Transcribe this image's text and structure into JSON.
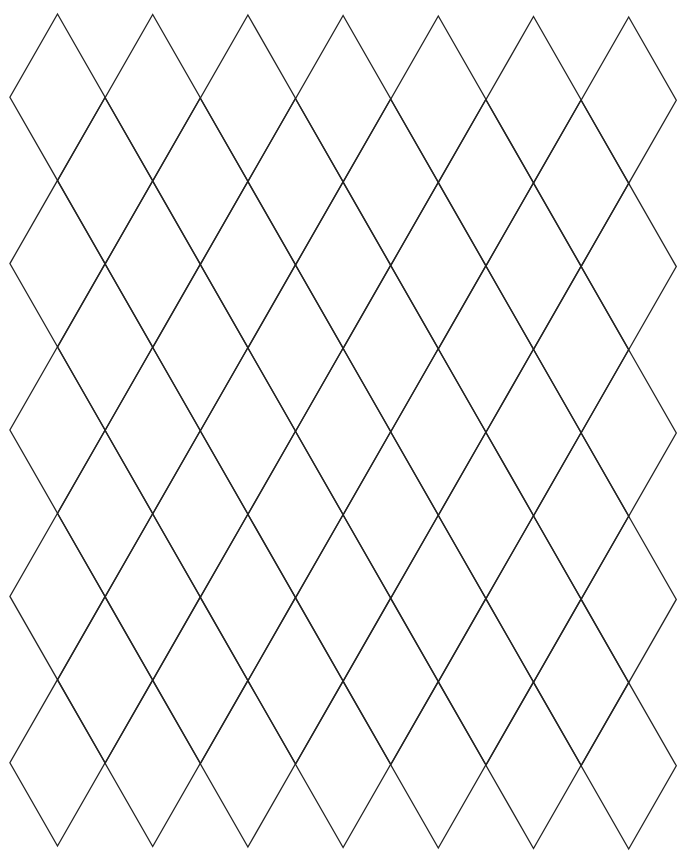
{
  "page": {
    "background": "#ffffff"
  },
  "grid": {
    "pattern": "diamond-lattice",
    "columns": 7,
    "rows": 5,
    "origin_top_vertex": [
      57.5,
      14
    ],
    "column_spacing": 95.2,
    "row_spacing": 166.4,
    "half_width": 47.6,
    "half_height": 83.2,
    "skew_y_per_column": 0.5,
    "line_color": "#222222",
    "line_width": 1.3
  }
}
